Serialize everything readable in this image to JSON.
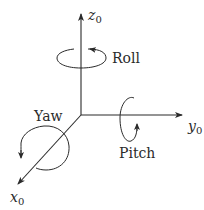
{
  "diagram": {
    "colors": {
      "stroke": "#2a2a2a",
      "background": "#ffffff"
    },
    "axes": [
      {
        "id": "z",
        "name": "z",
        "subscript": "0",
        "direction": "up"
      },
      {
        "id": "y",
        "name": "y",
        "subscript": "0",
        "direction": "right"
      },
      {
        "id": "x",
        "name": "x",
        "subscript": "0",
        "direction": "down-left"
      }
    ],
    "rotations": [
      {
        "id": "roll",
        "label": "Roll",
        "about_axis": "z"
      },
      {
        "id": "pitch",
        "label": "Pitch",
        "about_axis": "y"
      },
      {
        "id": "yaw",
        "label": "Yaw",
        "about_axis": "x"
      }
    ]
  }
}
